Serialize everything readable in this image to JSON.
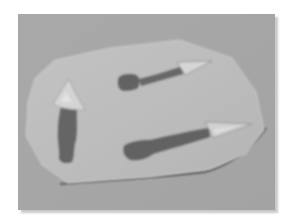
{
  "image": {
    "description": "Grayscale photo of an irregular paper cutout with three painted arrows on a gray background",
    "colors": {
      "frame": "#ffffff",
      "background": "#a8a8a8",
      "paper": "#bdbdbd",
      "paper_edge": "#3a3a3a",
      "arrow_shaft": "#6a6a6a",
      "arrow_head": "#d2d2d2"
    },
    "objects": [
      {
        "name": "left-arrow",
        "direction": "up"
      },
      {
        "name": "top-arrow",
        "direction": "right"
      },
      {
        "name": "bottom-arrow",
        "direction": "right"
      }
    ]
  }
}
